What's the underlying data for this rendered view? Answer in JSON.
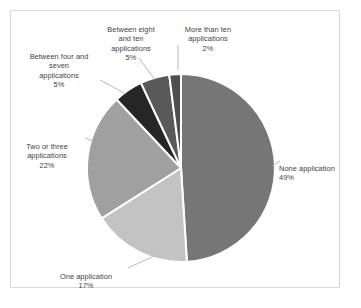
{
  "chart_data": {
    "type": "pie",
    "title": "",
    "legend": "none",
    "labels_position": "outside-with-leader-lines",
    "categories": [
      "None application",
      "One application",
      "Two or three applications",
      "Between four and seven applications",
      "Between eight and ten applications",
      "More than ten applications"
    ],
    "values": [
      49,
      17,
      22,
      5,
      5,
      2
    ],
    "value_suffix": "%",
    "colors": [
      "#767676",
      "#c3c3c3",
      "#a0a0a0",
      "#262626",
      "#595959",
      "#4f4f4f"
    ],
    "slice_border_color": "#ffffff",
    "start_angle_deg": 0,
    "direction": "clockwise",
    "xlabel": "",
    "ylabel": ""
  },
  "frame": {
    "border_color": "#d9d9d9",
    "background": "#ffffff"
  },
  "labels": {
    "none": {
      "name": "None application",
      "value": "49%"
    },
    "one": {
      "name": "One application",
      "value": "17%"
    },
    "two_three": {
      "name": "Two or three\napplications",
      "value": "22%"
    },
    "four_seven": {
      "name": "Between four and\nseven\napplications",
      "value": "5%"
    },
    "eight_ten": {
      "name": "Between eight\nand ten\napplications",
      "value": "5%"
    },
    "more_ten": {
      "name": "More than ten\napplications",
      "value": "2%"
    }
  }
}
